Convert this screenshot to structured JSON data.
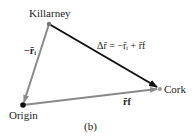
{
  "diagram": {
    "points": {
      "killarney": {
        "label": "Killarney",
        "x": 49,
        "y": 24
      },
      "cork": {
        "label": "Cork",
        "x": 160,
        "y": 89
      },
      "origin": {
        "label": "Origin",
        "x": 23,
        "y": 105
      }
    },
    "vectors": {
      "neg_ri": {
        "label": "−r̄ᵢ",
        "color": "#8a8a8a",
        "from": "killarney",
        "to": "origin"
      },
      "rf": {
        "label": "r̄f",
        "color": "#8a8a8a",
        "from": "origin",
        "to": "cork"
      },
      "delta_r": {
        "label": "Δr̄ = −r̄ᵢ + r̄f",
        "color": "#111111",
        "from": "killarney",
        "to": "cork"
      }
    },
    "caption": "(b)"
  }
}
